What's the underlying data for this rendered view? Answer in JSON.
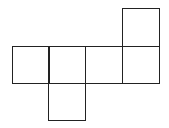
{
  "diagram": {
    "type": "cube-net",
    "stroke_color": "#222222",
    "square_size": 37,
    "faces": [
      {
        "id": "face-1",
        "row": 1,
        "col": 0,
        "x": 12,
        "y": 46
      },
      {
        "id": "face-2",
        "row": 1,
        "col": 1,
        "x": 49,
        "y": 46
      },
      {
        "id": "face-3",
        "row": 1,
        "col": 2,
        "x": 86,
        "y": 46
      },
      {
        "id": "face-4",
        "row": 1,
        "col": 3,
        "x": 122,
        "y": 46
      },
      {
        "id": "face-5",
        "row": 0,
        "col": 3,
        "x": 122,
        "y": 8
      },
      {
        "id": "face-6",
        "row": 2,
        "col": 1,
        "x": 49,
        "y": 84
      }
    ]
  }
}
